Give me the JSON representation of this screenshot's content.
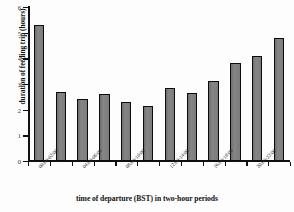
{
  "chart_data": {
    "type": "bar",
    "title": "",
    "xlabel": "time of departure (BST) in two-hour periods",
    "ylabel": "duration of feeding trip (hours)",
    "categories": [
      "00:00-02:00",
      "02:00-04:00",
      "04:00-06:00",
      "06:00-08:00",
      "08:00-10:00",
      "10:00-12:00",
      "12:00-14:00",
      "14:00-16:00",
      "16:00-18:00",
      "18:00-20:00",
      "20:00-22:00",
      "22:00-24:00"
    ],
    "visible_tick_labels": [
      "00:00-02:00",
      "04:00-06:00",
      "08:00-10:00",
      "12:00-14:00",
      "16:00-18:00",
      "20:00-22:00"
    ],
    "values": [
      5.3,
      2.7,
      2.4,
      2.6,
      2.3,
      2.15,
      2.85,
      2.65,
      3.1,
      3.8,
      4.1,
      4.8
    ],
    "ylim": [
      0,
      6
    ],
    "yticks": [
      0,
      1,
      2,
      3,
      4,
      5,
      6
    ],
    "ytick_labels": [
      "0",
      "1",
      "2",
      "3",
      "4",
      "5",
      "6"
    ],
    "grid": false,
    "legend": false,
    "bar_color": "#7c7c7c",
    "bar_edge_color": "#0c0c0c",
    "axis_color": "#111111",
    "background": "#fdfdfd"
  }
}
